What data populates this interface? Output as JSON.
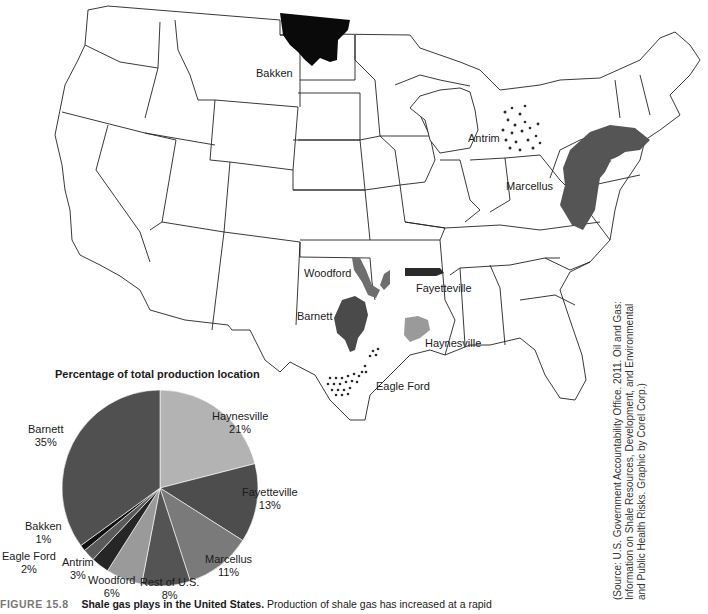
{
  "map": {
    "labels": {
      "bakken": "Bakken",
      "antrim": "Antrim",
      "marcellus": "Marcellus",
      "woodford": "Woodford",
      "fayetteville": "Fayetteville",
      "barnett": "Barnett",
      "haynesville": "Haynesville",
      "eagle_ford": "Eagle Ford"
    },
    "colors": {
      "bakken": "#0a0a0a",
      "marcellus": "#555555",
      "woodford": "#6e6e6e",
      "fayetteville": "#2a2a2a",
      "barnett": "#4a4a4a",
      "haynesville": "#9a9a9a",
      "dots": "#3a3a3a"
    }
  },
  "chart_data": {
    "type": "pie",
    "title": "Percentage of total production location",
    "categories": [
      "Haynesville",
      "Fayetteville",
      "Marcellus",
      "Rest of U.S.",
      "Woodford",
      "Antrim",
      "Eagle Ford",
      "Bakken",
      "Barnett"
    ],
    "values": [
      21,
      13,
      11,
      8,
      6,
      3,
      2,
      1,
      35
    ],
    "unit": "%",
    "colors": [
      "#b3b3b3",
      "#4d4d4d",
      "#7a7a7a",
      "#545454",
      "#9a9a9a",
      "#262626",
      "#5a5a5a",
      "#111111",
      "#505050"
    ],
    "labels": [
      {
        "name": "Haynesville",
        "pct": "21%"
      },
      {
        "name": "Fayetteville",
        "pct": "13%"
      },
      {
        "name": "Marcellus",
        "pct": "11%"
      },
      {
        "name": "Rest of U.S.",
        "pct": "8%"
      },
      {
        "name": "Woodford",
        "pct": "6%"
      },
      {
        "name": "Antrim",
        "pct": "3%"
      },
      {
        "name": "Eagle Ford",
        "pct": "2%"
      },
      {
        "name": "Bakken",
        "pct": "1%"
      },
      {
        "name": "Barnett",
        "pct": "35%"
      }
    ]
  },
  "caption": {
    "figure_number": "FIGURE 15.8",
    "heading": "Shale gas plays in the United States.",
    "text": "Production of shale gas has increased at a rapid"
  },
  "source": {
    "line1": "(Source: U.S. Government Accountability Office. 2011. Oil and Gas:",
    "line2": "Information on Shale Resources, Development, and Environmental",
    "line3": "and Public Health Risks. Graphic by Corel Corp.)"
  }
}
